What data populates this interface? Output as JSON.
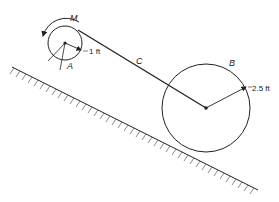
{
  "diagram": {
    "labels": {
      "moment": "M",
      "small_wheel": "A",
      "cable": "C",
      "large_wheel": "B",
      "small_radius": "1 ft",
      "large_radius": "2.5 ft"
    },
    "colors": {
      "line": "#222222",
      "background": "#ffffff"
    }
  }
}
